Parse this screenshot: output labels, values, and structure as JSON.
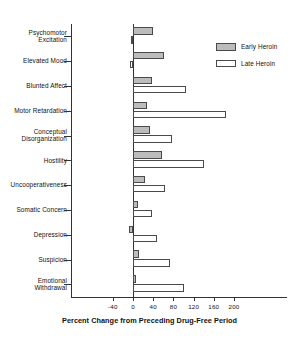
{
  "chart_data": {
    "type": "bar",
    "orientation": "horizontal",
    "title": "",
    "xlabel": "Percent Change from Preceding Drug-Free Period",
    "ylabel": "",
    "xlim": [
      -60,
      220
    ],
    "xticks": [
      -40,
      0,
      40,
      80,
      120,
      160,
      200
    ],
    "xtick_labels": [
      "-40",
      "0",
      "40",
      "80",
      "120",
      "160",
      "200"
    ],
    "grid": false,
    "legend_position": "upper-right",
    "categories": [
      "Psychomotor Excitation",
      "Elevated Mood",
      "Blunted Affect",
      "Motor Retardation",
      "Conceptual Disorganization",
      "Hostility",
      "Uncooperativeness",
      "Somatic Concern",
      "Depression",
      "Suspicion",
      "Emotional Withdrawal"
    ],
    "category_lines": [
      [
        "Psychomotor",
        "Excitation"
      ],
      [
        "Elevated Mood"
      ],
      [
        "Blunted Affect"
      ],
      [
        "Motor Retardation"
      ],
      [
        "Conceptual",
        "Disorganization"
      ],
      [
        "Hostility"
      ],
      [
        "Uncooperativeness"
      ],
      [
        "Somatic Concern"
      ],
      [
        "Depression"
      ],
      [
        "Suspicion"
      ],
      [
        "Emotional",
        "Withdrawal"
      ]
    ],
    "series": [
      {
        "name": "Early Heroin",
        "color": "#bcbcbc",
        "values": [
          40,
          62,
          38,
          27,
          33,
          57,
          23,
          9,
          -8,
          11,
          5
        ]
      },
      {
        "name": "Late Heroin",
        "color": "#ffffff",
        "values": [
          -3,
          -5,
          105,
          185,
          78,
          140,
          63,
          38,
          47,
          73,
          100
        ]
      }
    ]
  },
  "legend": {
    "items": [
      {
        "label": "Early Heroin",
        "swatch": "early"
      },
      {
        "label": "Late Heroin",
        "swatch": "late"
      }
    ]
  },
  "axis": {
    "x_title": "Percent Change from Preceding Drug-Free Period"
  }
}
